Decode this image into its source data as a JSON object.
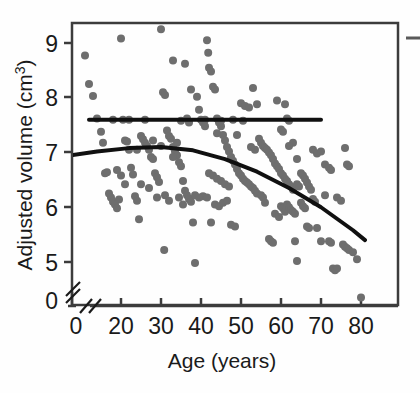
{
  "figure": {
    "background": "#fefefe",
    "frame_color": "#3c3c3c",
    "point_color": "#6e6e6e",
    "curve_color": "#101010"
  },
  "axes": {
    "x_title": "Age (years)",
    "y_title_main": "Adjusted volume (cm",
    "y_title_sup": "3",
    "y_title_close": ")",
    "x_ticks": [
      "0",
      "20",
      "30",
      "40",
      "50",
      "60",
      "70",
      "80"
    ],
    "y_ticks": [
      "0",
      "5",
      "6",
      "7",
      "8",
      "9"
    ],
    "x_break": "//",
    "y_break": "//"
  },
  "chart_data": {
    "type": "scatter",
    "title": "",
    "xlabel": "Age (years)",
    "ylabel": "Adjusted volume (cm3)",
    "xlim": [
      4,
      82
    ],
    "ylim": [
      4.2,
      9.4
    ],
    "x_tick_values": [
      20,
      30,
      40,
      50,
      60,
      70,
      80
    ],
    "y_tick_values": [
      5,
      6,
      7,
      8,
      9
    ],
    "axis_break_x": true,
    "axis_break_y": true,
    "grid": false,
    "legend": "none",
    "marker": {
      "shape": "circle",
      "size_px": 8,
      "color": "#6e6e6e"
    },
    "points": [
      [
        5.0,
        6.65
      ],
      [
        7.0,
        8.78
      ],
      [
        11.0,
        8.77
      ],
      [
        12.0,
        8.25
      ],
      [
        13.0,
        8.03
      ],
      [
        14.0,
        7.62
      ],
      [
        15.0,
        7.38
      ],
      [
        15.5,
        7.18
      ],
      [
        16.0,
        6.62
      ],
      [
        16.5,
        6.64
      ],
      [
        17.0,
        6.25
      ],
      [
        17.5,
        6.18
      ],
      [
        18.0,
        6.1
      ],
      [
        18.5,
        6.05
      ],
      [
        19.0,
        5.98
      ],
      [
        19.5,
        6.14
      ],
      [
        20.0,
        9.08
      ],
      [
        20.5,
        7.6
      ],
      [
        21.0,
        7.22
      ],
      [
        21.5,
        7.2
      ],
      [
        22.0,
        7.05
      ],
      [
        22.5,
        6.72
      ],
      [
        23.0,
        6.6
      ],
      [
        23.5,
        6.2
      ],
      [
        24.0,
        6.12
      ],
      [
        24.5,
        5.78
      ],
      [
        25.0,
        7.3
      ],
      [
        25.5,
        7.24
      ],
      [
        26.0,
        7.18
      ],
      [
        26.5,
        7.12
      ],
      [
        27.0,
        7.05
      ],
      [
        27.5,
        6.92
      ],
      [
        28.0,
        6.88
      ],
      [
        28.5,
        6.62
      ],
      [
        29.0,
        6.55
      ],
      [
        29.5,
        6.46
      ],
      [
        30.0,
        9.25
      ],
      [
        30.5,
        8.1
      ],
      [
        31.0,
        8.05
      ],
      [
        31.5,
        7.4
      ],
      [
        32.0,
        7.3
      ],
      [
        32.5,
        7.25
      ],
      [
        33.0,
        7.1
      ],
      [
        33.5,
        7.02
      ],
      [
        34.0,
        6.95
      ],
      [
        34.5,
        6.82
      ],
      [
        35.0,
        6.75
      ],
      [
        35.5,
        6.48
      ],
      [
        36.0,
        6.3
      ],
      [
        36.5,
        6.22
      ],
      [
        37.0,
        6.15
      ],
      [
        37.5,
        6.1
      ],
      [
        38.0,
        5.72
      ],
      [
        38.5,
        4.98
      ],
      [
        30.8,
        5.22
      ],
      [
        33.0,
        8.68
      ],
      [
        36.0,
        8.62
      ],
      [
        37.5,
        8.15
      ],
      [
        39.0,
        8.02
      ],
      [
        39.5,
        7.78
      ],
      [
        40.0,
        7.6
      ],
      [
        40.5,
        7.55
      ],
      [
        41.0,
        7.48
      ],
      [
        41.5,
        9.05
      ],
      [
        41.8,
        8.82
      ],
      [
        42.0,
        8.55
      ],
      [
        42.5,
        8.48
      ],
      [
        43.0,
        8.2
      ],
      [
        43.5,
        8.15
      ],
      [
        44.0,
        7.62
      ],
      [
        44.5,
        7.55
      ],
      [
        45.0,
        7.48
      ],
      [
        45.5,
        7.32
      ],
      [
        46.0,
        7.22
      ],
      [
        46.5,
        7.1
      ],
      [
        47.0,
        7.02
      ],
      [
        47.5,
        6.92
      ],
      [
        48.0,
        6.85
      ],
      [
        48.5,
        6.78
      ],
      [
        49.0,
        6.7
      ],
      [
        49.5,
        6.62
      ],
      [
        50.0,
        6.58
      ],
      [
        50.5,
        6.52
      ],
      [
        51.0,
        6.48
      ],
      [
        51.5,
        6.45
      ],
      [
        52.0,
        6.42
      ],
      [
        52.5,
        6.38
      ],
      [
        53.0,
        6.35
      ],
      [
        53.5,
        6.3
      ],
      [
        54.0,
        6.25
      ],
      [
        42.0,
        6.62
      ],
      [
        43.0,
        6.58
      ],
      [
        44.0,
        6.52
      ],
      [
        45.0,
        6.48
      ],
      [
        46.0,
        6.42
      ],
      [
        47.0,
        6.38
      ],
      [
        43.5,
        6.05
      ],
      [
        44.5,
        6.02
      ],
      [
        45.5,
        6.08
      ],
      [
        46.5,
        6.12
      ],
      [
        40.5,
        6.2
      ],
      [
        41.5,
        6.18
      ],
      [
        38.5,
        6.22
      ],
      [
        39.5,
        6.18
      ],
      [
        42.5,
        5.72
      ],
      [
        47.5,
        5.68
      ],
      [
        48.5,
        5.65
      ],
      [
        50.0,
        7.9
      ],
      [
        51.0,
        7.85
      ],
      [
        52.0,
        7.82
      ],
      [
        53.0,
        8.18
      ],
      [
        54.0,
        7.88
      ],
      [
        54.5,
        7.25
      ],
      [
        55.0,
        7.18
      ],
      [
        55.5,
        7.12
      ],
      [
        56.0,
        7.08
      ],
      [
        56.5,
        7.05
      ],
      [
        57.0,
        7.0
      ],
      [
        57.5,
        6.95
      ],
      [
        58.0,
        6.88
      ],
      [
        58.5,
        6.8
      ],
      [
        59.0,
        6.75
      ],
      [
        59.5,
        6.7
      ],
      [
        60.0,
        6.62
      ],
      [
        60.5,
        6.58
      ],
      [
        61.0,
        6.52
      ],
      [
        61.5,
        6.48
      ],
      [
        62.0,
        6.42
      ],
      [
        62.5,
        6.38
      ],
      [
        63.0,
        6.32
      ],
      [
        55.0,
        6.22
      ],
      [
        55.5,
        6.18
      ],
      [
        56.0,
        6.08
      ],
      [
        57.0,
        5.42
      ],
      [
        57.5,
        5.38
      ],
      [
        58.0,
        5.35
      ],
      [
        59.0,
        7.95
      ],
      [
        60.0,
        7.42
      ],
      [
        60.5,
        7.38
      ],
      [
        61.0,
        7.88
      ],
      [
        61.5,
        7.62
      ],
      [
        62.0,
        7.58
      ],
      [
        58.5,
        5.88
      ],
      [
        59.5,
        5.82
      ],
      [
        60.0,
        6.02
      ],
      [
        60.5,
        5.98
      ],
      [
        61.0,
        5.92
      ],
      [
        61.5,
        6.05
      ],
      [
        62.0,
        6.0
      ],
      [
        62.5,
        5.95
      ],
      [
        63.0,
        5.92
      ],
      [
        63.5,
        5.88
      ],
      [
        64.0,
        6.42
      ],
      [
        64.5,
        6.38
      ],
      [
        65.0,
        6.62
      ],
      [
        65.5,
        6.58
      ],
      [
        66.0,
        6.52
      ],
      [
        66.5,
        6.45
      ],
      [
        67.0,
        6.38
      ],
      [
        67.5,
        6.32
      ],
      [
        63.5,
        5.38
      ],
      [
        64.0,
        5.02
      ],
      [
        65.0,
        6.08
      ],
      [
        65.5,
        6.02
      ],
      [
        66.0,
        5.98
      ],
      [
        66.5,
        5.65
      ],
      [
        67.0,
        5.62
      ],
      [
        68.0,
        6.15
      ],
      [
        68.5,
        6.1
      ],
      [
        69.0,
        5.62
      ],
      [
        70.0,
        5.38
      ],
      [
        68.0,
        7.05
      ],
      [
        69.0,
        6.98
      ],
      [
        70.0,
        7.02
      ],
      [
        71.0,
        6.78
      ],
      [
        72.0,
        6.72
      ],
      [
        72.5,
        6.68
      ],
      [
        71.0,
        6.22
      ],
      [
        72.0,
        5.38
      ],
      [
        72.5,
        5.35
      ],
      [
        73.0,
        4.88
      ],
      [
        73.5,
        4.85
      ],
      [
        74.0,
        4.88
      ],
      [
        74.0,
        6.18
      ],
      [
        75.0,
        6.12
      ],
      [
        75.5,
        5.32
      ],
      [
        76.0,
        5.28
      ],
      [
        76.5,
        5.25
      ],
      [
        77.0,
        5.22
      ],
      [
        76.0,
        7.08
      ],
      [
        76.5,
        6.78
      ],
      [
        77.0,
        6.75
      ],
      [
        78.0,
        5.18
      ],
      [
        79.0,
        5.05
      ],
      [
        80.0,
        4.35
      ],
      [
        63.0,
        7.18
      ],
      [
        62.0,
        7.12
      ],
      [
        64.0,
        6.88
      ],
      [
        50.5,
        7.58
      ],
      [
        48.0,
        7.6
      ],
      [
        35.0,
        7.58
      ],
      [
        36.5,
        7.62
      ],
      [
        37.0,
        7.55
      ],
      [
        26.0,
        7.6
      ],
      [
        22.0,
        7.6
      ],
      [
        18.0,
        7.6
      ],
      [
        45.0,
        7.58
      ],
      [
        41.0,
        7.6
      ],
      [
        44.0,
        7.35
      ],
      [
        49.0,
        7.32
      ],
      [
        53.5,
        7.05
      ],
      [
        52.5,
        7.1
      ],
      [
        30.0,
        7.12
      ],
      [
        28.0,
        7.22
      ],
      [
        24.0,
        7.05
      ],
      [
        34.0,
        7.18
      ],
      [
        33.0,
        6.92
      ],
      [
        19.0,
        6.68
      ],
      [
        20.0,
        6.58
      ],
      [
        21.0,
        6.42
      ],
      [
        25.0,
        6.42
      ],
      [
        27.0,
        6.35
      ],
      [
        29.0,
        6.18
      ],
      [
        31.0,
        6.22
      ],
      [
        32.0,
        6.12
      ],
      [
        34.5,
        6.18
      ],
      [
        35.5,
        6.05
      ]
    ],
    "series_lines": [
      {
        "name": "constant-reference-line",
        "style": "solid",
        "color": "#101010",
        "width_px": 4,
        "x_range": [
          12,
          70
        ],
        "y_value": 7.6,
        "description": "flat horizontal line at 7.6"
      },
      {
        "name": "quadratic-fit-curve",
        "style": "solid",
        "color": "#101010",
        "width_px": 4,
        "description": "downward-bending quadratic fit peaking near age 30",
        "x_points": [
          6,
          14,
          22,
          30,
          38,
          46,
          54,
          62,
          70,
          78,
          81
        ],
        "y_points": [
          6.93,
          7.02,
          7.08,
          7.1,
          7.04,
          6.88,
          6.65,
          6.35,
          6.0,
          5.58,
          5.4
        ]
      }
    ]
  },
  "legend_stub": {
    "present": true,
    "description": "cropped line segment at right edge"
  }
}
